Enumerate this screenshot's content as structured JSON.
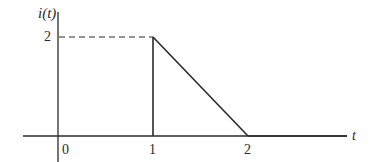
{
  "diagram": {
    "y_axis_label": "i(t)",
    "x_axis_label": "t",
    "y_ticks": [
      {
        "value": 2,
        "label": "2"
      }
    ],
    "x_ticks": [
      {
        "value": 0,
        "label": "0"
      },
      {
        "value": 1,
        "label": "1"
      },
      {
        "value": 2,
        "label": "2"
      }
    ],
    "waveform": {
      "description": "i(t)=0 for t<1, jumps to 2 at t=1, decreases linearly to 0 at t=2, then 0 for t>2",
      "points": [
        [
          -0.4,
          0
        ],
        [
          1,
          0
        ],
        [
          1,
          2
        ],
        [
          2,
          0
        ],
        [
          3.0,
          0
        ]
      ]
    },
    "guide": {
      "style": "dashed",
      "from": [
        0,
        2
      ],
      "to": [
        1,
        2
      ]
    },
    "colors": {
      "line": "#2a2a2a",
      "background": "#ffffff"
    }
  }
}
